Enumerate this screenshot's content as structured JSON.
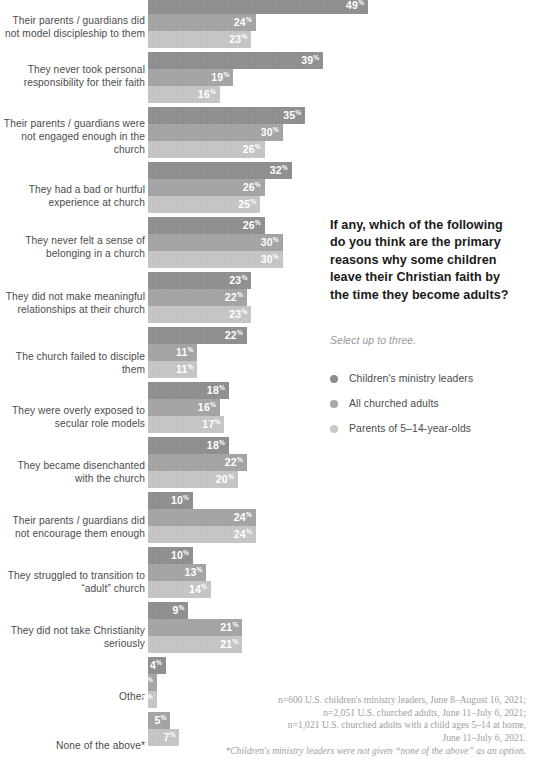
{
  "question": "If any, which of the following do you think are the primary reasons why some children leave their Christian faith by the time they become adults?",
  "subnote": "Select up to three.",
  "legend": [
    {
      "label": "Children's ministry leaders",
      "color": "#8e8e8e"
    },
    {
      "label": "All churched adults",
      "color": "#a8a8a8"
    },
    {
      "label": "Parents of 5–14-year-olds",
      "color": "#c8c8c8"
    }
  ],
  "footnote": {
    "line1": "n=600 U.S. children's ministry leaders, June 8–August 16, 2021;",
    "line2": "n=2,051 U.S. churched adults, June 11–July 6, 2021;",
    "line3": "n=1,021 U.S. churched adults with a child ages 5–14 at home,",
    "line4": "June 11–July 6, 2021.",
    "line5": "*Children's ministry leaders were not given “none of the above” as an option."
  },
  "chart_data": {
    "type": "bar",
    "title": "If any, which of the following do you think are the primary reasons why some children leave their Christian faith by the time they become adults?",
    "subtitle": "Select up to three.",
    "orientation": "horizontal",
    "unit": "%",
    "xlabel": "",
    "ylabel": "",
    "xlim": [
      0,
      49
    ],
    "grid": false,
    "legend_position": "right",
    "categories": [
      "Their parents / guardians did not model discipleship to them",
      "They never took personal responsibility for their faith",
      "Their parents / guardians were not engaged enough in the church",
      "They had a bad or hurtful experience at church",
      "They never felt a sense of belonging in a church",
      "They did not make meaningful relationships at their church",
      "The church failed to disciple them",
      "They were overly exposed to secular role models",
      "They became disenchanted with the church",
      "Their parents / guardians did not encourage them enough",
      "They struggled to transition to “adult” church",
      "They did not take Christianity seriously",
      "Other",
      "None of the above*"
    ],
    "series": [
      {
        "name": "Children's ministry leaders",
        "color": "#8e8e8e",
        "values": [
          49,
          39,
          35,
          32,
          26,
          23,
          22,
          18,
          18,
          10,
          10,
          9,
          4,
          null
        ]
      },
      {
        "name": "All churched adults",
        "color": "#a3a3a3",
        "values": [
          24,
          19,
          30,
          26,
          30,
          22,
          11,
          16,
          22,
          24,
          13,
          21,
          2,
          5
        ]
      },
      {
        "name": "Parents of 5–14-year-olds",
        "color": "#c4c4c4",
        "values": [
          23,
          16,
          26,
          25,
          30,
          23,
          11,
          17,
          20,
          24,
          14,
          21,
          2,
          7
        ]
      }
    ]
  },
  "layout": {
    "bar_start_x": 148,
    "px_per_percent": 4.49,
    "bar_height": 17,
    "group_tops": [
      -3,
      52,
      107,
      162,
      217,
      272,
      327,
      382,
      437,
      492,
      547,
      602,
      657,
      712
    ],
    "label_tops": [
      14,
      63,
      117,
      183,
      234,
      290,
      350,
      404,
      459,
      514,
      569,
      624,
      690,
      739
    ]
  }
}
